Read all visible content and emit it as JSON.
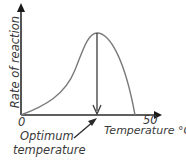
{
  "diagram": {
    "y_axis_label": "Rate of reaction",
    "x_axis_label": "Temperature °C",
    "x_origin_label": "0",
    "x_tick_label": "50",
    "annotation_line1": "Optimum",
    "annotation_line2": "temperature",
    "curve_color": "#7a7a7a",
    "axis_color": "#2a2a2a"
  }
}
